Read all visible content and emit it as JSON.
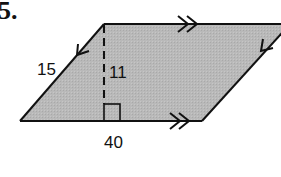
{
  "problem": {
    "number": "5."
  },
  "figure": {
    "shape": "parallelogram",
    "fill_color": "#b8b8b8",
    "stroke_color": "#111111",
    "labels": {
      "side": "15",
      "height": "11",
      "base": "40"
    },
    "markers": {
      "top_edge": "double-arrow",
      "bottom_edge": "double-arrow",
      "left_edge": "single-arrow",
      "right_edge": "single-arrow",
      "right_angle": true,
      "altitude": "dashed"
    }
  }
}
